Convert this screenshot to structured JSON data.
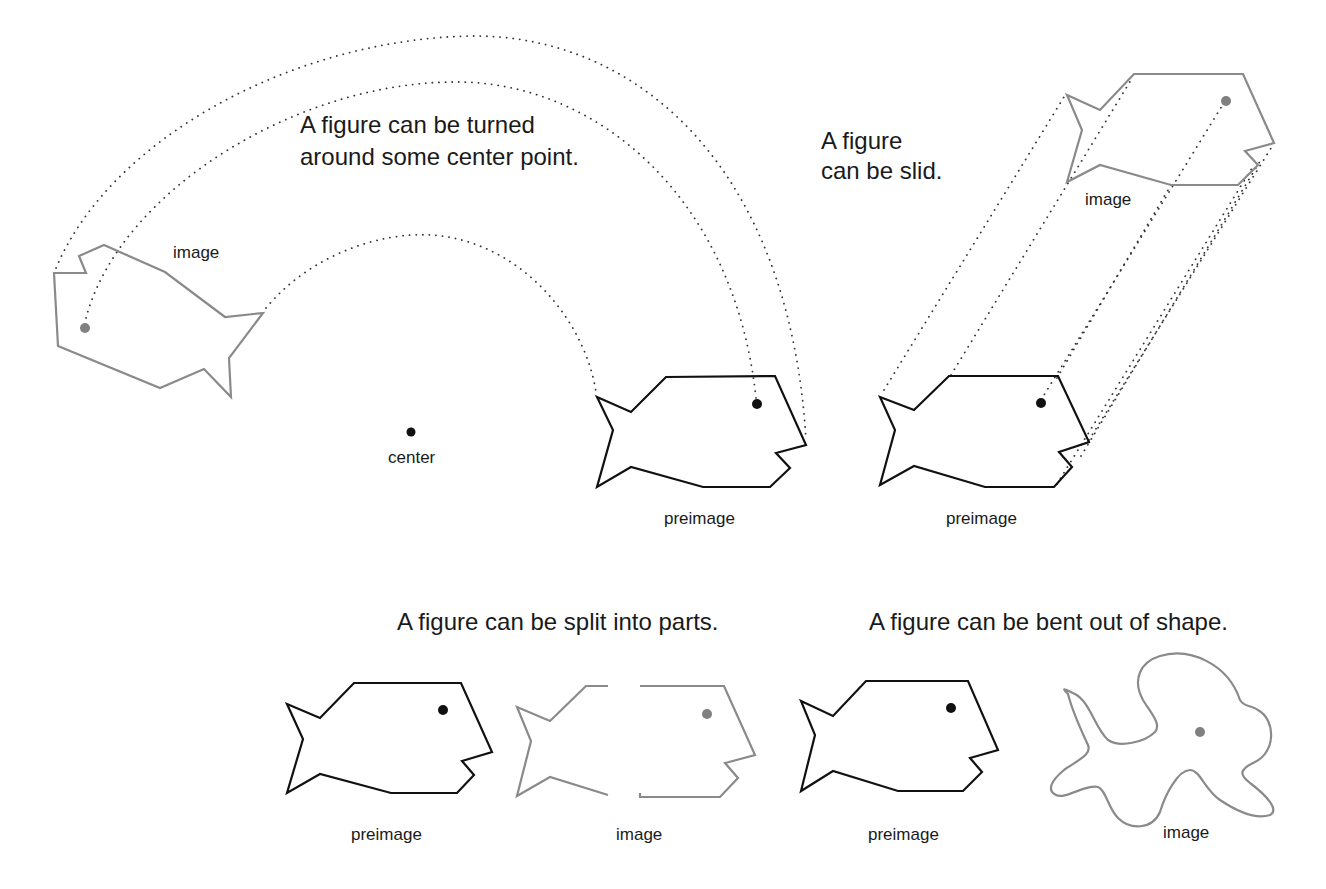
{
  "colors": {
    "preimage_stroke": "#111111",
    "image_stroke": "#8a8a8a",
    "preimage_dot": "#111111",
    "image_dot": "#808080",
    "background": "#ffffff"
  },
  "rotation": {
    "caption_line1": "A figure can be turned",
    "caption_line2": "around some center point.",
    "image_label": "image",
    "center_label": "center",
    "preimage_label": "preimage"
  },
  "slide": {
    "caption_line1": "A figure",
    "caption_line2": "can be slid.",
    "image_label": "image",
    "preimage_label": "preimage"
  },
  "split": {
    "caption": "A figure can be split into parts.",
    "preimage_label": "preimage",
    "image_label": "image"
  },
  "bend": {
    "caption": "A figure can be bent out of shape.",
    "preimage_label": "preimage",
    "image_label": "image"
  }
}
